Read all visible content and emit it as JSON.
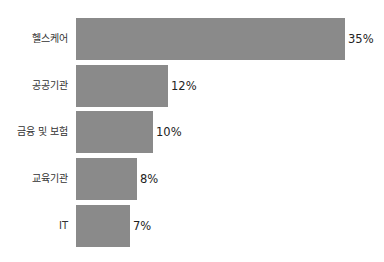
{
  "chart_data": {
    "type": "bar",
    "orientation": "horizontal",
    "title": "",
    "xlabel": "",
    "ylabel": "",
    "categories": [
      "헬스케어",
      "공공기관",
      "금융 및 보험",
      "교육기관",
      "IT"
    ],
    "values": [
      35,
      12,
      10,
      8,
      7
    ],
    "value_labels": [
      "35%",
      "12%",
      "10%",
      "8%",
      "7%"
    ],
    "unit": "%",
    "bar_color": "#8a8a8a",
    "grid": false,
    "legend": null
  }
}
